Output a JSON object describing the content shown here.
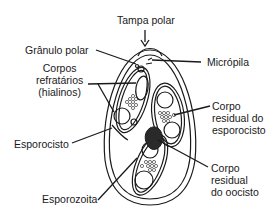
{
  "diagram": {
    "labels": {
      "tampa_polar": "Tampa polar",
      "granulo_polar": "Grânulo polar",
      "micropila": "Micrópila",
      "corpos_refratarios": [
        "Corpos",
        "refratários",
        "(hialinos)"
      ],
      "corpo_residual_esporocisto": [
        "Corpo",
        "residual do",
        "esporocisto"
      ],
      "esporocisto": "Esporocisto",
      "corpo_residual_oocisto": [
        "Corpo",
        "residual",
        "do oocisto"
      ],
      "esporozoita": "Esporozoita"
    },
    "colors": {
      "line": "#1a1a1a",
      "fill": "#ffffff",
      "residual_body": "#2a2a2a"
    }
  }
}
